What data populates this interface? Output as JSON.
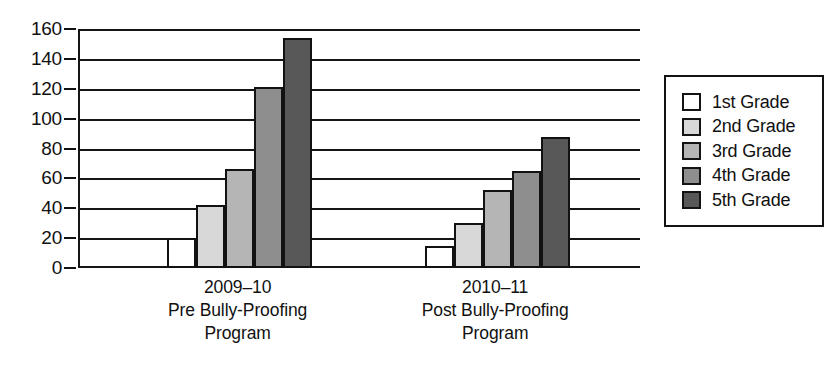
{
  "chart_data": {
    "type": "bar",
    "title": "",
    "subtitle": "",
    "xlabel": "",
    "ylabel": "",
    "ylim": [
      0,
      160
    ],
    "yticks": [
      0,
      20,
      40,
      60,
      80,
      100,
      120,
      140,
      160
    ],
    "ytick_labels": [
      "0",
      "20",
      "40",
      "60",
      "80",
      "100",
      "120",
      "140",
      "160"
    ],
    "grid": "horizontal",
    "legend_position": "right",
    "categories": [
      "2009–10\nPre Bully-Proofing\nProgram",
      "2010–11\nPost Bully-Proofing\nProgram"
    ],
    "category_lines": [
      [
        "2009–10",
        "Pre Bully-Proofing",
        "Program"
      ],
      [
        "2010–11",
        "Post Bully-Proofing",
        "Program"
      ]
    ],
    "series": [
      {
        "name": "1st Grade",
        "color": "#ffffff",
        "values": [
          20,
          15
        ]
      },
      {
        "name": "2nd Grade",
        "color": "#d8d8d8",
        "values": [
          42,
          30
        ]
      },
      {
        "name": "3rd Grade",
        "color": "#b5b5b5",
        "values": [
          66,
          52
        ]
      },
      {
        "name": "4th Grade",
        "color": "#8e8e8e",
        "values": [
          121,
          65
        ]
      },
      {
        "name": "5th Grade",
        "color": "#585858",
        "values": [
          154,
          88
        ]
      }
    ]
  },
  "legend": {
    "entries": [
      {
        "label": "1st Grade",
        "color": "#ffffff"
      },
      {
        "label": "2nd Grade",
        "color": "#d8d8d8"
      },
      {
        "label": "3rd Grade",
        "color": "#b5b5b5"
      },
      {
        "label": "4th Grade",
        "color": "#8e8e8e"
      },
      {
        "label": "5th Grade",
        "color": "#585858"
      }
    ]
  },
  "colors": {
    "axis": "#151515",
    "grid": "#151515",
    "text": "#111111",
    "background": "#ffffff"
  }
}
